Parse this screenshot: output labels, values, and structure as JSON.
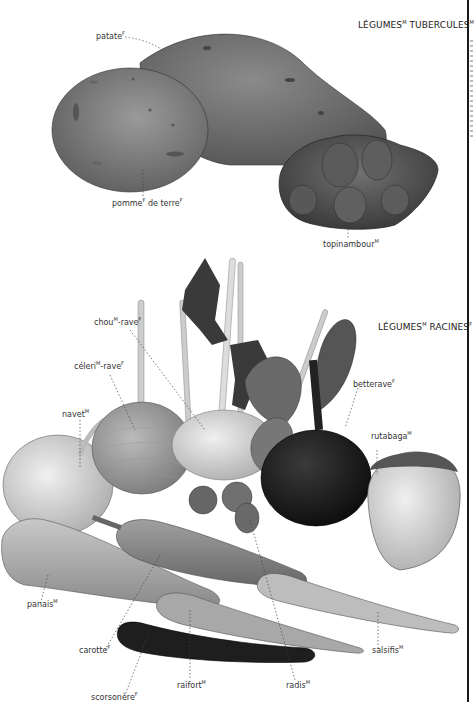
{
  "sections": {
    "tubers": {
      "title": "LÉGUMES",
      "title_gender": "M",
      "title2": " TUBERCULES",
      "title2_gender": "M"
    },
    "roots": {
      "title": "LÉGUMES",
      "title_gender": "M",
      "title2": " RACINES",
      "title2_gender": "F"
    }
  },
  "labels": {
    "patate": {
      "text": "patate",
      "gender": "F"
    },
    "pomme_de_terre": {
      "text1": "pomme",
      "g1": "F",
      "text2": " de terre",
      "g2": "F"
    },
    "topinambour": {
      "text": "topinambour",
      "gender": "M"
    },
    "chou_rave": {
      "text1": "chou",
      "g1": "M",
      "text2": "-rave",
      "g2": "F"
    },
    "celeri_rave": {
      "text1": "céleri",
      "g1": "M",
      "text2": "-rave",
      "g2": "F"
    },
    "navet": {
      "text": "navet",
      "gender": "M"
    },
    "betterave": {
      "text": "betterave",
      "gender": "F"
    },
    "rutabaga": {
      "text": "rutabaga",
      "gender": "M"
    },
    "panais": {
      "text": "panais",
      "gender": "M"
    },
    "carotte": {
      "text": "carotte",
      "gender": "F"
    },
    "salsifis": {
      "text": "salsifis",
      "gender": "M"
    },
    "raifort": {
      "text": "raifort",
      "gender": "M"
    },
    "radis": {
      "text": "radis",
      "gender": "M"
    },
    "scorsonere": {
      "text": "scorsonère",
      "gender": "F"
    }
  }
}
